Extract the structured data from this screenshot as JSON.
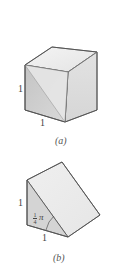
{
  "figure_a": {
    "caption": "(a)",
    "shape": "cube",
    "height_label": "1",
    "width_label": "1"
  },
  "figure_b": {
    "caption": "(b)",
    "shape": "triangular wedge",
    "height_label": "1",
    "width_label": "1",
    "angle_label_numerator": "1",
    "angle_label_denominator": "4",
    "angle_label_symbol": "π"
  },
  "colors": {
    "edge": "#555555",
    "top_face": "#ededed",
    "front_face": "#cfcfcf",
    "side_face": "#dedede",
    "light_face": "#e9e9e9"
  }
}
